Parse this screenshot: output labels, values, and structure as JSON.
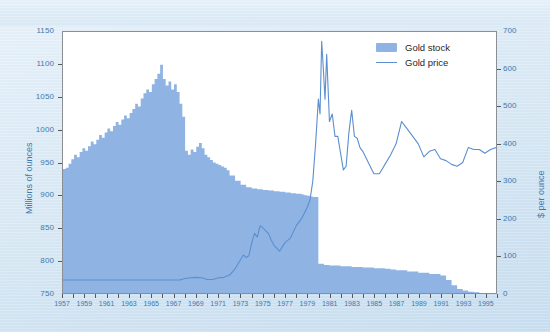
{
  "chart_data": {
    "type": "area",
    "title": "",
    "xlabel": "",
    "ylabel": "Millions of ounces",
    "y2label": "$ per ounce",
    "grid": false,
    "legend_position": "top-right",
    "xlim": [
      1957,
      1996
    ],
    "ylim": [
      750,
      1150
    ],
    "y2lim": [
      0,
      700
    ],
    "yticks": [
      750,
      800,
      850,
      900,
      950,
      1000,
      1050,
      1100,
      1150
    ],
    "y2ticks": [
      0,
      100,
      200,
      300,
      400,
      500,
      600,
      700
    ],
    "xticks": [
      1957,
      1959,
      1961,
      1963,
      1965,
      1967,
      1969,
      1971,
      1973,
      1975,
      1977,
      1979,
      1981,
      1983,
      1985,
      1987,
      1989,
      1991,
      1993,
      1995
    ],
    "xticks_all": [
      1957,
      1958,
      1959,
      1960,
      1961,
      1962,
      1963,
      1964,
      1965,
      1966,
      1967,
      1968,
      1969,
      1970,
      1971,
      1972,
      1973,
      1974,
      1975,
      1976,
      1977,
      1978,
      1979,
      1980,
      1981,
      1982,
      1983,
      1984,
      1985,
      1986,
      1987,
      1988,
      1989,
      1990,
      1991,
      1992,
      1993,
      1994,
      1995,
      1996
    ],
    "series": [
      {
        "name": "Gold stock",
        "type": "area",
        "axis": "left",
        "color": "#8fb4e3",
        "x": [
          1957.0,
          1957.25,
          1957.5,
          1957.75,
          1958.0,
          1958.25,
          1958.5,
          1958.75,
          1959.0,
          1959.25,
          1959.5,
          1959.75,
          1960.0,
          1960.25,
          1960.5,
          1960.75,
          1961.0,
          1961.25,
          1961.5,
          1961.75,
          1962.0,
          1962.25,
          1962.5,
          1962.75,
          1963.0,
          1963.25,
          1963.5,
          1963.75,
          1964.0,
          1964.25,
          1964.5,
          1964.75,
          1965.0,
          1965.25,
          1965.5,
          1965.75,
          1966.0,
          1966.25,
          1966.5,
          1966.75,
          1967.0,
          1967.25,
          1967.5,
          1967.75,
          1968.0,
          1968.25,
          1968.5,
          1968.75,
          1969.0,
          1969.25,
          1969.5,
          1969.75,
          1970.0,
          1970.25,
          1970.5,
          1970.75,
          1971.0,
          1971.25,
          1971.5,
          1971.75,
          1972.0,
          1972.5,
          1973.0,
          1973.5,
          1974.0,
          1974.5,
          1975.0,
          1975.5,
          1976.0,
          1976.5,
          1977.0,
          1977.5,
          1978.0,
          1978.5,
          1978.75,
          1979.0,
          1979.25,
          1979.5,
          1980.0,
          1980.5,
          1981.0,
          1982.0,
          1983.0,
          1984.0,
          1985.0,
          1986.0,
          1986.5,
          1987.0,
          1988.0,
          1989.0,
          1990.0,
          1991.0,
          1991.5,
          1992.0,
          1992.5,
          1993.0,
          1993.5,
          1994.0,
          1994.5,
          1995.0,
          1995.5,
          1996.0
        ],
        "y": [
          940,
          942,
          948,
          955,
          962,
          958,
          966,
          972,
          968,
          975,
          982,
          978,
          985,
          992,
          988,
          996,
          1002,
          998,
          1006,
          1012,
          1008,
          1016,
          1022,
          1018,
          1026,
          1032,
          1040,
          1036,
          1048,
          1056,
          1062,
          1058,
          1070,
          1078,
          1086,
          1100,
          1078,
          1068,
          1074,
          1062,
          1070,
          1058,
          1040,
          1020,
          968,
          962,
          970,
          966,
          974,
          980,
          972,
          962,
          958,
          954,
          950,
          948,
          946,
          944,
          942,
          938,
          930,
          922,
          916,
          912,
          910,
          909,
          908,
          907,
          906,
          905,
          904,
          903,
          902,
          901,
          900,
          899,
          898,
          897,
          795,
          793,
          792,
          791,
          790,
          789,
          788,
          787,
          786,
          785,
          783,
          781,
          779,
          777,
          770,
          762,
          756,
          754,
          752,
          751,
          750,
          749,
          748,
          747
        ]
      },
      {
        "name": "Gold price",
        "type": "line",
        "axis": "right",
        "color": "#5b8fcf",
        "x": [
          1957,
          1958,
          1959,
          1960,
          1961,
          1962,
          1963,
          1964,
          1965,
          1966,
          1967,
          1967.5,
          1968,
          1968.5,
          1969,
          1969.5,
          1970,
          1970.5,
          1971,
          1971.5,
          1972,
          1972.5,
          1973,
          1973.25,
          1973.5,
          1973.75,
          1974,
          1974.25,
          1974.5,
          1974.75,
          1975,
          1975.25,
          1975.5,
          1975.75,
          1976,
          1976.5,
          1977,
          1977.5,
          1978,
          1978.5,
          1979,
          1979.25,
          1979.5,
          1979.75,
          1980.0,
          1980.15,
          1980.3,
          1980.45,
          1980.6,
          1980.75,
          1981.0,
          1981.25,
          1981.5,
          1981.75,
          1982.0,
          1982.25,
          1982.5,
          1982.75,
          1983.0,
          1983.25,
          1983.5,
          1983.75,
          1984.0,
          1984.5,
          1985.0,
          1985.5,
          1986.0,
          1986.5,
          1987.0,
          1987.5,
          1988.0,
          1988.5,
          1989.0,
          1989.5,
          1990.0,
          1990.5,
          1991.0,
          1991.5,
          1992.0,
          1992.5,
          1993.0,
          1993.5,
          1994.0,
          1994.5,
          1995.0,
          1995.5,
          1996.0
        ],
        "y": [
          35,
          35,
          35,
          35,
          35,
          35,
          35,
          35,
          35,
          35,
          35,
          35,
          39,
          41,
          42,
          41,
          36,
          36,
          41,
          42,
          48,
          65,
          90,
          102,
          95,
          100,
          135,
          160,
          150,
          180,
          175,
          167,
          160,
          142,
          128,
          112,
          135,
          148,
          180,
          200,
          230,
          250,
          300,
          400,
          520,
          480,
          675,
          600,
          520,
          640,
          460,
          480,
          420,
          420,
          375,
          330,
          340,
          430,
          490,
          420,
          415,
          390,
          380,
          350,
          320,
          320,
          345,
          370,
          400,
          460,
          440,
          420,
          400,
          365,
          380,
          385,
          360,
          355,
          345,
          340,
          350,
          390,
          385,
          385,
          375,
          385,
          390
        ]
      }
    ]
  },
  "legend": {
    "items": [
      {
        "label": "Gold stock",
        "marker": "swatch"
      },
      {
        "label": "Gold price",
        "marker": "line"
      }
    ]
  },
  "axes": {
    "left_title": "Millions of ounces",
    "right_title": "$ per ounce"
  },
  "colors": {
    "area_fill": "#8fb4e3",
    "line": "#5b8fcf",
    "axis_text": "#3f78ad",
    "plot_border": "#8b8f93",
    "page_background": "#dceaf5"
  }
}
